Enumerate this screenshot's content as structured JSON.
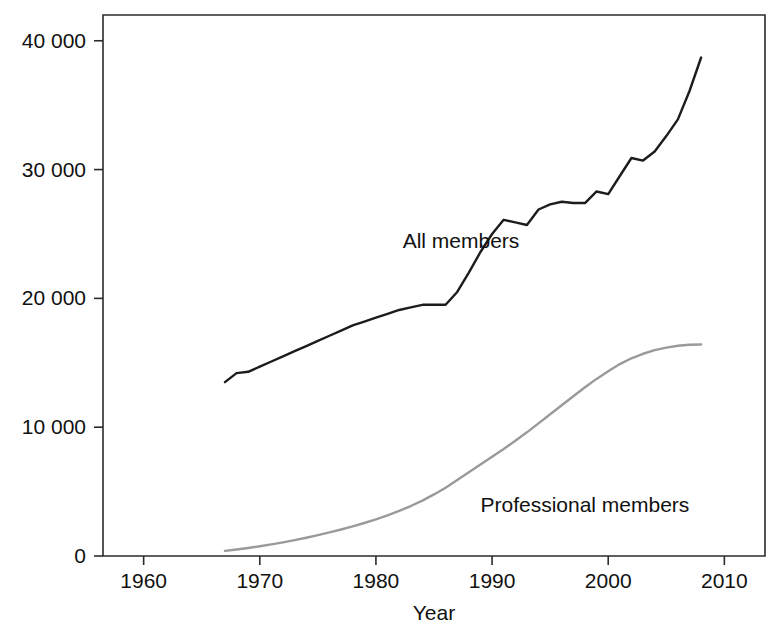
{
  "chart_data": {
    "type": "line",
    "title": "",
    "xlabel": "Year",
    "ylabel": "",
    "xlim": [
      1956.5,
      2013.5
    ],
    "ylim": [
      0,
      42000
    ],
    "grid": false,
    "legend_position": "inline-annotation",
    "x_ticks": [
      1960,
      1970,
      1980,
      1990,
      2000,
      2010
    ],
    "x_tick_labels": [
      "1960",
      "1970",
      "1980",
      "1990",
      "2000",
      "2010"
    ],
    "y_ticks": [
      0,
      10000,
      20000,
      30000,
      40000
    ],
    "y_tick_labels": [
      "0",
      "10 000",
      "20 000",
      "30 000",
      "40 000"
    ],
    "series": [
      {
        "name": "All members",
        "color": "#1c1c1c",
        "label_x": 1982.3,
        "label_y": 23900,
        "x": [
          1967,
          1968,
          1969,
          1970,
          1971,
          1972,
          1973,
          1974,
          1975,
          1976,
          1977,
          1978,
          1979,
          1980,
          1981,
          1982,
          1983,
          1984,
          1985,
          1986,
          1987,
          1988,
          1989,
          1990,
          1991,
          1992,
          1993,
          1994,
          1995,
          1996,
          1997,
          1998,
          1999,
          2000,
          2001,
          2002,
          2003,
          2004,
          2005,
          2006,
          2007,
          2008
        ],
        "values": [
          13500,
          14200,
          14300,
          14700,
          15100,
          15500,
          15900,
          16300,
          16700,
          17100,
          17500,
          17900,
          18200,
          18500,
          18800,
          19100,
          19300,
          19500,
          19500,
          19500,
          20500,
          22000,
          23600,
          25000,
          26100,
          25900,
          25700,
          26900,
          27300,
          27500,
          27400,
          27400,
          28300,
          28100,
          29500,
          30900,
          30700,
          31400,
          32600,
          33900,
          36100,
          38700
        ]
      },
      {
        "name": "Professional members",
        "color": "#9a9a9a",
        "label_x": 1989.0,
        "label_y": 3400,
        "x": [
          1967,
          1968,
          1969,
          1970,
          1971,
          1972,
          1973,
          1974,
          1975,
          1976,
          1977,
          1978,
          1979,
          1980,
          1981,
          1982,
          1983,
          1984,
          1985,
          1986,
          1987,
          1988,
          1989,
          1990,
          1991,
          1992,
          1993,
          1994,
          1995,
          1996,
          1997,
          1998,
          1999,
          2000,
          2001,
          2002,
          2003,
          2004,
          2005,
          2006,
          2007,
          2008
        ],
        "values": [
          400,
          500,
          620,
          760,
          900,
          1060,
          1230,
          1420,
          1620,
          1830,
          2060,
          2300,
          2560,
          2840,
          3150,
          3500,
          3880,
          4300,
          4780,
          5300,
          5900,
          6500,
          7100,
          7700,
          8300,
          8950,
          9600,
          10300,
          11000,
          11700,
          12400,
          13100,
          13750,
          14350,
          14900,
          15350,
          15700,
          15980,
          16180,
          16320,
          16400,
          16420
        ]
      }
    ]
  }
}
